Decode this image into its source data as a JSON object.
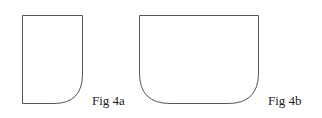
{
  "figures": [
    {
      "label": "Fig 4a",
      "shape": "rectangle with rounded bottom-right corner"
    },
    {
      "label": "Fig 4b",
      "shape": "rectangle with rounded bottom corners"
    }
  ],
  "colors": {
    "stroke": "#555555",
    "text": "#1a1a1a",
    "background": "#ffffff"
  }
}
